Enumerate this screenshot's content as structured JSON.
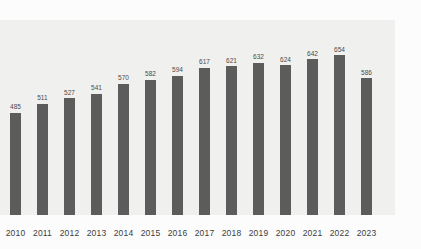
{
  "chart_data": {
    "type": "bar",
    "title": "",
    "subtitle": "",
    "xlabel": "",
    "ylabel": "",
    "grid": false,
    "legend": "none",
    "axis_baseline_value": 185,
    "ylim": [
      185,
      675
    ],
    "categories": [
      "2010",
      "2011",
      "2012",
      "2013",
      "2014",
      "2015",
      "2016",
      "2017",
      "2018",
      "2019",
      "2020",
      "2021",
      "2022",
      "2023"
    ],
    "values": [
      485,
      511,
      527,
      541,
      570,
      582,
      594,
      617,
      621,
      632,
      624,
      642,
      654,
      586
    ],
    "value_labels": [
      "485",
      "511",
      "527",
      "541",
      "570",
      "582",
      "594",
      "617",
      "621",
      "632",
      "624",
      "642",
      "654",
      "586"
    ],
    "tick_labels": [
      "2010",
      "2011",
      "2012",
      "2013",
      "2014",
      "2015",
      "2016",
      "2017",
      "2018",
      "2019",
      "2020",
      "2021",
      "2022",
      "2023"
    ],
    "series": [
      {
        "name": "",
        "values": [
          485,
          511,
          527,
          541,
          570,
          582,
          594,
          617,
          621,
          632,
          624,
          642,
          654,
          586
        ]
      }
    ]
  },
  "colors": {
    "bar": "#5c5c5c",
    "plot_background": "#f0f0ee",
    "page_background": "#fcfcfc",
    "value_label": "#4a4a4a",
    "tick_label": "#3c3c3c"
  }
}
